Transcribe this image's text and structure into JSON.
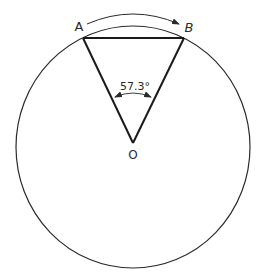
{
  "diagram": {
    "labels": {
      "point_a": "A",
      "point_b": "B",
      "center": "O",
      "angle": "57.3°"
    },
    "geometry": {
      "circle": {
        "cx": 133,
        "cy": 147,
        "rx": 117,
        "ry": 121
      },
      "point_a": {
        "x": 83,
        "y": 38
      },
      "point_b": {
        "x": 184,
        "y": 38
      },
      "center_o": {
        "x": 133,
        "y": 143
      }
    },
    "colors": {
      "stroke": "#2a2a2a",
      "background": "#ffffff"
    }
  }
}
